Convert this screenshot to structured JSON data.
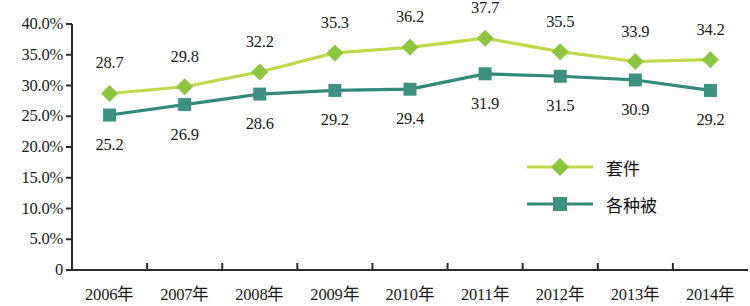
{
  "chart_data": {
    "type": "line",
    "title": "",
    "subtitle": "",
    "xlabel": "",
    "ylabel": "",
    "grid": false,
    "legend_position": "center-right",
    "categories": [
      "2006年",
      "2007年",
      "2008年",
      "2009年",
      "2010年",
      "2011年",
      "2012年",
      "2013年",
      "2014年"
    ],
    "ylim": [
      0,
      40
    ],
    "y_tick_labels": [
      "0",
      "5.0%",
      "10.0%",
      "15.0%",
      "20.0%",
      "25.0%",
      "30.0%",
      "35.0%",
      "40.0%"
    ],
    "y_tick_values": [
      0,
      5,
      10,
      15,
      20,
      25,
      30,
      35,
      40
    ],
    "series": [
      {
        "name": "套件",
        "marker": "diamond",
        "color": "#8CC63E",
        "line_color": "#BFD94B",
        "label_position": "above",
        "values": [
          28.7,
          29.8,
          32.2,
          35.3,
          36.2,
          37.7,
          35.5,
          33.9,
          34.2
        ],
        "value_labels": [
          "28.7",
          "29.8",
          "32.2",
          "35.3",
          "36.2",
          "37.7",
          "35.5",
          "33.9",
          "34.2"
        ]
      },
      {
        "name": "各种被",
        "marker": "square",
        "color": "#3E9180",
        "line_color": "#35897A",
        "label_position": "below",
        "values": [
          25.2,
          26.9,
          28.6,
          29.2,
          29.4,
          31.9,
          31.5,
          30.9,
          29.2
        ],
        "value_labels": [
          "25.2",
          "26.9",
          "28.6",
          "29.2",
          "29.4",
          "31.9",
          "31.5",
          "30.9",
          "29.2"
        ]
      }
    ]
  },
  "legend": {
    "items": [
      {
        "label": "套件",
        "marker": "diamond",
        "color": "#8CC63E"
      },
      {
        "label": "各种被",
        "marker": "square",
        "color": "#3E9180"
      }
    ]
  },
  "axis": {
    "line_color": "#2b2b2b"
  }
}
